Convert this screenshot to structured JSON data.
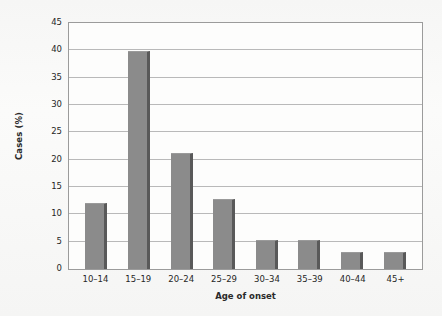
{
  "chart_data": {
    "type": "bar",
    "title": "",
    "xlabel": "Age of onset",
    "ylabel": "Cases (%)",
    "categories": [
      "10–14",
      "15–19",
      "20–24",
      "25–29",
      "30–34",
      "35–39",
      "40–44",
      "45+"
    ],
    "values": [
      12.0,
      39.8,
      21.2,
      12.8,
      5.3,
      5.3,
      3.2,
      3.2
    ],
    "ylim": [
      0,
      45
    ],
    "ytick_labels": [
      "0",
      "5",
      "10",
      "15",
      "20",
      "25",
      "30",
      "35",
      "40",
      "45"
    ],
    "ytick_values": [
      0,
      5,
      10,
      15,
      20,
      25,
      30,
      35,
      40,
      45
    ],
    "grid": true,
    "legend": null,
    "series": [
      {
        "name": "Cases (%)",
        "values": [
          12.0,
          39.8,
          21.2,
          12.8,
          5.3,
          5.3,
          3.2,
          3.2
        ]
      }
    ],
    "colors": {
      "bar_fill": "#8b8b8b",
      "bar_edge": "#595959",
      "gridline": "#b9b9b9",
      "axis": "#9b9b9b",
      "plot_background": "#fdfdfc",
      "page_background": "#f7f7f6",
      "text": "#262626"
    }
  }
}
